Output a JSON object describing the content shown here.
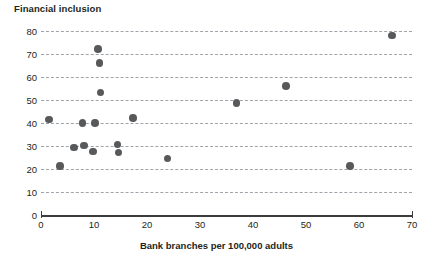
{
  "chart_data": {
    "type": "scatter",
    "title": "Financial inclusion",
    "xlabel": "Bank branches per 100,000 adults",
    "ylabel": "",
    "xlim": [
      0,
      70
    ],
    "ylim": [
      0,
      80
    ],
    "xticks": [
      0,
      10,
      20,
      30,
      40,
      50,
      60,
      70
    ],
    "yticks": [
      0,
      10,
      20,
      30,
      40,
      50,
      60,
      70,
      80
    ],
    "grid": "horizontal-dashed",
    "legend": "none",
    "marker_color": "#58595b",
    "grid_color": "#9aa0a6",
    "axis_color": "#3c3c3c",
    "points": [
      {
        "x": 1.5,
        "y": 41.5
      },
      {
        "x": 3.6,
        "y": 21.3
      },
      {
        "x": 6.2,
        "y": 29.3
      },
      {
        "x": 7.8,
        "y": 39.9
      },
      {
        "x": 8.1,
        "y": 30.3
      },
      {
        "x": 9.8,
        "y": 27.6
      },
      {
        "x": 10.2,
        "y": 39.9
      },
      {
        "x": 10.8,
        "y": 72.2
      },
      {
        "x": 11.0,
        "y": 66.2
      },
      {
        "x": 11.2,
        "y": 53.3
      },
      {
        "x": 14.4,
        "y": 30.6
      },
      {
        "x": 14.6,
        "y": 27.1
      },
      {
        "x": 17.4,
        "y": 42.3
      },
      {
        "x": 23.9,
        "y": 24.6
      },
      {
        "x": 36.9,
        "y": 48.6
      },
      {
        "x": 46.2,
        "y": 56.0
      },
      {
        "x": 58.3,
        "y": 21.2
      },
      {
        "x": 66.2,
        "y": 78.0
      }
    ]
  }
}
